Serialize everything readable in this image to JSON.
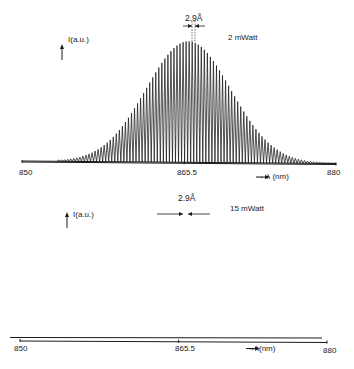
{
  "chart_data": [
    {
      "type": "line",
      "title": "",
      "annotation_power": "2 mWatt",
      "annotation_spacing": "2.9Å",
      "xlabel": "λ (nm)",
      "ylabel": "I (a.u.)",
      "xlim": [
        850,
        880
      ],
      "x_ticks": [
        "850",
        "865.5",
        "880"
      ],
      "grid": false,
      "description": "Multimode laser spectrum: comb of longitudinal modes spaced 2.9 Å under a broad bell-shaped envelope centered near 865.5 nm",
      "mode_spacing_nm": 0.29,
      "envelope": {
        "center_nm": 865.9,
        "fwhm_nm": 9.5,
        "peak_rel": 1.0,
        "extent_nm": [
          853.5,
          880
        ]
      }
    },
    {
      "type": "line",
      "title": "",
      "annotation_power": "15 mWatt",
      "annotation_spacing": "2.9Å",
      "xlabel": "λ (nm)",
      "ylabel": "I (a.u.)",
      "xlim": [
        850,
        880
      ],
      "x_ticks": [
        "850",
        "865.5",
        "880"
      ],
      "grid": false,
      "description": "Multimode laser spectrum at higher power: fewer dominant longitudinal modes spaced 2.9 Å with a narrow envelope centered near 865.5 nm",
      "mode_spacing_nm": 0.29,
      "envelope": {
        "center_nm": 865.6,
        "fwhm_nm": 4.0,
        "peak_rel": 1.0,
        "extent_nm": [
          858,
          875
        ]
      }
    }
  ],
  "top": {
    "ylabel": "I(a.u.)",
    "power": "2 mWatt",
    "spacing": "2.9Å",
    "xlabel": "→ λ (nm)",
    "ticks": {
      "left": "850",
      "center": "865.5",
      "right": "880"
    }
  },
  "bottom": {
    "ylabel": "I(a.u.)",
    "power": "15 mWatt",
    "spacing": "2.9Å",
    "xlabel": "→λ(nm)",
    "ticks": {
      "left": "850",
      "center": "865.5",
      "right": "880"
    }
  }
}
